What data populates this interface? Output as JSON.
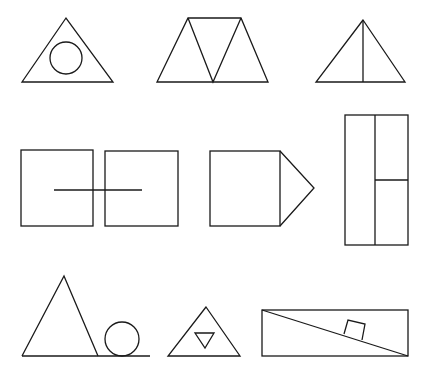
{
  "figure": {
    "stroke_color": "#1a1a1a",
    "background_color": "#ffffff",
    "rows": [
      {
        "items": [
          {
            "name": "triangle-with-inscribed-circle",
            "shapes": [
              "triangle",
              "circle"
            ]
          },
          {
            "name": "trapezoid-of-three-triangles",
            "shapes": [
              "trapezoid",
              "triangle",
              "triangle",
              "triangle"
            ]
          },
          {
            "name": "triangle-with-vertical-bisector",
            "shapes": [
              "triangle",
              "line"
            ]
          }
        ]
      },
      {
        "items": [
          {
            "name": "two-squares-joined-by-line",
            "shapes": [
              "square",
              "square",
              "line"
            ]
          },
          {
            "name": "square-with-triangle-point",
            "shapes": [
              "square",
              "triangle"
            ]
          },
          {
            "name": "tall-rectangle-split",
            "shapes": [
              "rectangle",
              "line",
              "line"
            ]
          }
        ]
      },
      {
        "items": [
          {
            "name": "triangle-and-circle-on-line",
            "shapes": [
              "triangle",
              "circle",
              "line"
            ]
          },
          {
            "name": "triangle-with-inverted-triangle",
            "shapes": [
              "triangle",
              "triangle"
            ]
          },
          {
            "name": "rectangle-incline-with-block",
            "shapes": [
              "rectangle",
              "line",
              "square"
            ]
          }
        ]
      }
    ]
  }
}
